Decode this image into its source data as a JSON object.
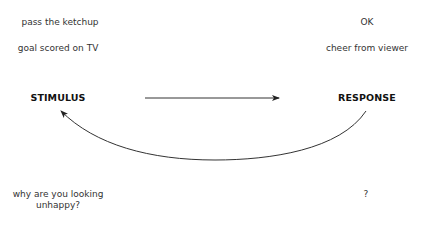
{
  "diagram": {
    "stimulus_label": "STIMULUS",
    "response_label": "RESPONSE",
    "pairs": [
      {
        "stimulus": "pass the ketchup",
        "response": "OK"
      },
      {
        "stimulus": "goal scored on TV",
        "response": "cheer from viewer"
      },
      {
        "stimulus": "why are you looking unhappy?",
        "response": "?"
      }
    ],
    "arrows": [
      {
        "from": "STIMULUS",
        "to": "RESPONSE",
        "style": "straight"
      },
      {
        "from": "RESPONSE",
        "to": "STIMULUS",
        "style": "curved-below"
      }
    ],
    "colors": {
      "line": "#333333",
      "text": "#333333",
      "background": "#ffffff"
    }
  }
}
